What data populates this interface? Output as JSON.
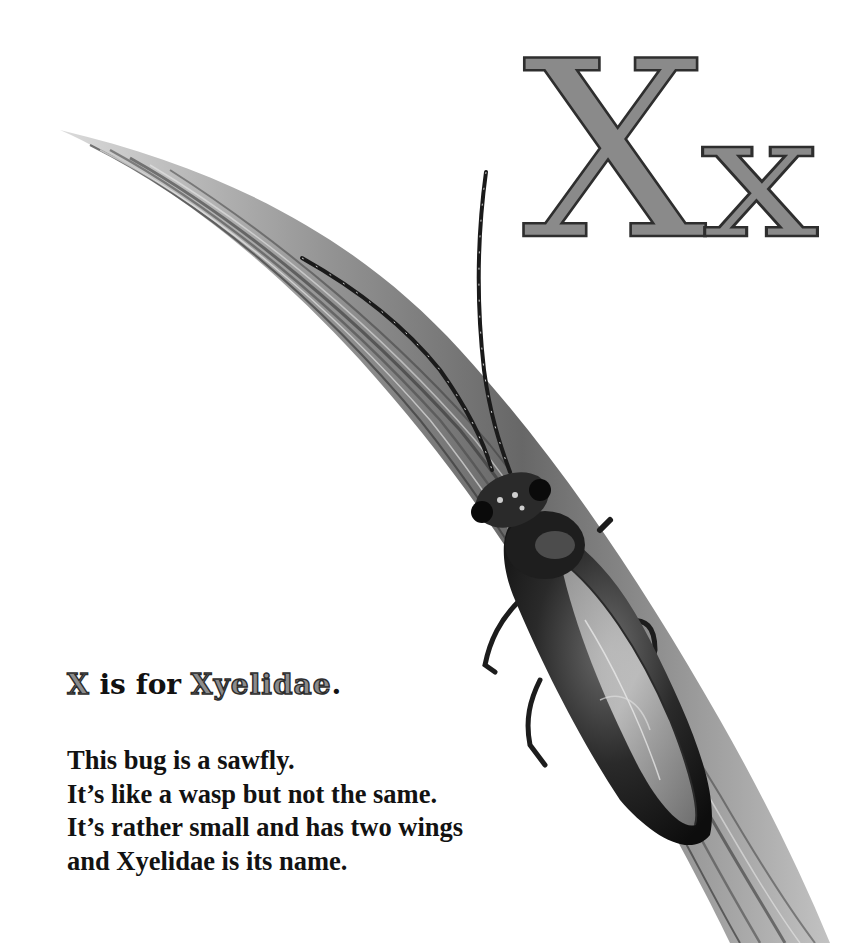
{
  "page": {
    "letter_upper": "X",
    "letter_lower": "x",
    "letter_fill": "#8a8a8a",
    "letter_outline": "#2e2e2e"
  },
  "heading": {
    "letter": "X",
    "connector": " is for ",
    "name": "Xyelidae",
    "terminal": "."
  },
  "verse": {
    "lines": [
      "This bug is a sawfly.",
      "It’s like a wasp but not the same.",
      "It’s rather small and has two wings",
      "and Xyelidae is its name."
    ]
  },
  "illustration": {
    "subject": "sawfly (Xyelidae) perched on a grass blade",
    "style": "grayscale pencil drawing"
  }
}
